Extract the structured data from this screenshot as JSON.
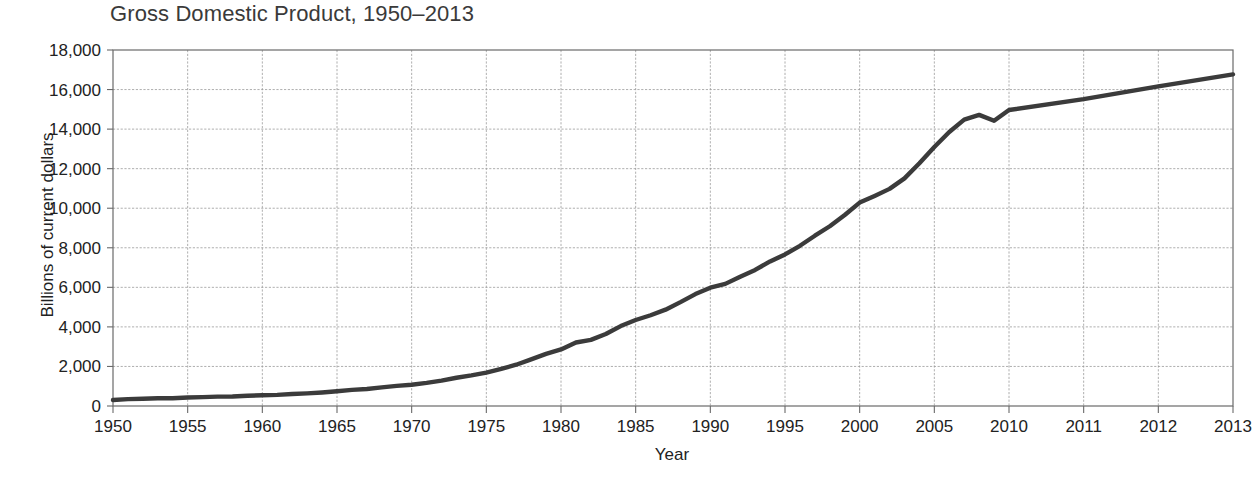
{
  "chart_data": {
    "type": "line",
    "title": "Gross Domestic Product, 1950–2013",
    "xlabel": "Year",
    "ylabel": "Billions of current dollars",
    "grid": true,
    "legend": "none",
    "ylim": [
      0,
      18000
    ],
    "ytick_labels": [
      "18,000",
      "16,000",
      "14,000",
      "12,000",
      "10,000",
      "8,000",
      "6,000",
      "4,000",
      "2,000",
      "0"
    ],
    "ytick_values": [
      18000,
      16000,
      14000,
      12000,
      10000,
      8000,
      6000,
      4000,
      2000,
      0
    ],
    "xtick_labels": [
      "1950",
      "1955",
      "1960",
      "1965",
      "1970",
      "1975",
      "1980",
      "1985",
      "1990",
      "1995",
      "2000",
      "2005",
      "2010",
      "2011",
      "2012",
      "2013"
    ],
    "xtick_values": [
      1950,
      1955,
      1960,
      1965,
      1970,
      1975,
      1980,
      1985,
      1990,
      1995,
      2000,
      2005,
      2010,
      2011,
      2012,
      2013
    ],
    "x_axis_note": "Axis spacing is categorical: 1950–2010 in 5-year steps, then 2011, 2012, 2013 each one full step wide",
    "series": [
      {
        "name": "Gross Domestic Product",
        "color": "#3b3b3b",
        "x": [
          1950,
          1951,
          1952,
          1953,
          1954,
          1955,
          1956,
          1957,
          1958,
          1959,
          1960,
          1961,
          1962,
          1963,
          1964,
          1965,
          1966,
          1967,
          1968,
          1969,
          1970,
          1971,
          1972,
          1973,
          1974,
          1975,
          1976,
          1977,
          1978,
          1979,
          1980,
          1981,
          1982,
          1983,
          1984,
          1985,
          1986,
          1987,
          1988,
          1989,
          1990,
          1991,
          1992,
          1993,
          1994,
          1995,
          1996,
          1997,
          1998,
          1999,
          2000,
          2001,
          2002,
          2003,
          2004,
          2005,
          2006,
          2007,
          2008,
          2009,
          2010,
          2011,
          2012,
          2013
        ],
        "values": [
          300,
          347,
          368,
          389,
          390,
          426,
          450,
          474,
          482,
          522,
          543,
          563,
          605,
          638,
          685,
          743,
          815,
          862,
          943,
          1020,
          1076,
          1168,
          1282,
          1429,
          1549,
          1689,
          1878,
          2086,
          2357,
          2632,
          2863,
          3211,
          3345,
          3638,
          4041,
          4347,
          4590,
          4870,
          5253,
          5658,
          5980,
          6174,
          6539,
          6879,
          7309,
          7664,
          8100,
          8609,
          9089,
          9661,
          10285,
          10622,
          10978,
          11511,
          12275,
          13094,
          13856,
          14478,
          14719,
          14419,
          14964,
          15518,
          16163,
          16768
        ]
      }
    ]
  }
}
